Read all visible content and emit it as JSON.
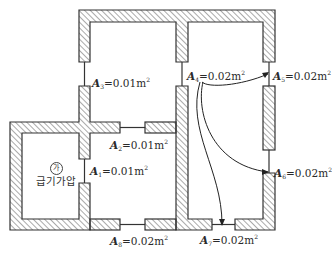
{
  "diagram": {
    "room_marker": "가",
    "room_name": "급기가압",
    "openings": [
      {
        "id": "A1",
        "letter": "A",
        "sub": "1",
        "value": "=0.01m",
        "sup": "2"
      },
      {
        "id": "A2",
        "letter": "A",
        "sub": "2",
        "value": "=0.01m",
        "sup": "2"
      },
      {
        "id": "A3",
        "letter": "A",
        "sub": "3",
        "value": "=0.01m",
        "sup": "2"
      },
      {
        "id": "A4",
        "letter": "A",
        "sub": "4",
        "value": "=0.02m",
        "sup": "2"
      },
      {
        "id": "A5",
        "letter": "A",
        "sub": "5",
        "value": "=0.02m",
        "sup": "2"
      },
      {
        "id": "A6",
        "letter": "A",
        "sub": "6",
        "value": "=0.02m",
        "sup": "2"
      },
      {
        "id": "A7",
        "letter": "A",
        "sub": "7",
        "value": "=0.02m",
        "sup": "2"
      },
      {
        "id": "A8",
        "letter": "A",
        "sub": "8",
        "value": "=0.02m",
        "sup": "2"
      }
    ],
    "colors": {
      "wall_stroke": "#333333",
      "hatch": "#555555",
      "background": "#ffffff"
    }
  }
}
